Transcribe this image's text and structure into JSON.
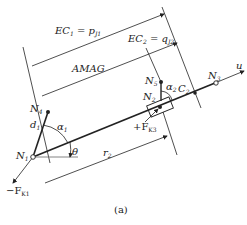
{
  "diagram": {
    "caption": "(a)",
    "labels": {
      "ec1": "EC",
      "ec1_sub": "1",
      "ec1_eq": " = p",
      "ec1_rhs_sub": "J1",
      "ec2": "EC",
      "ec2_sub": "2",
      "ec2_eq": " = q",
      "ec2_rhs_sub": "J2",
      "amag": "AMAG",
      "n1": "N",
      "n1_sub": "1",
      "n2": "N",
      "n2_sub": "2",
      "n3": "N",
      "n3_sub": "3",
      "n4": "N",
      "n4_sub": "4",
      "n5": "N",
      "n5_sub": "5",
      "c2": "C",
      "c2_sub": "2",
      "u": "u",
      "d1": "d",
      "d1_sub": "1",
      "alpha1": "α",
      "alpha1_sub": "1",
      "alpha2": "α",
      "alpha2_sub": "2",
      "theta": "θ",
      "r2": "r",
      "r2_sub": "2",
      "fk1": "−F",
      "fk1_sub": "K1",
      "fk3": "+F",
      "fk3_sub": "K3"
    }
  }
}
